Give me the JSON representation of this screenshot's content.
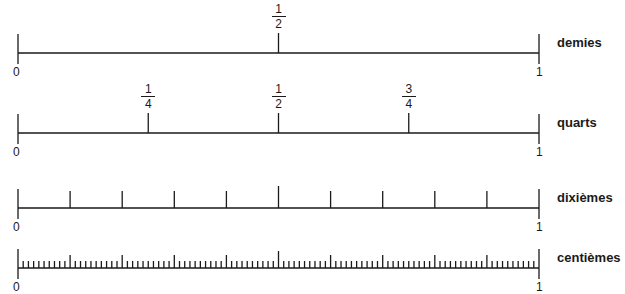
{
  "diagram": {
    "type": "number_lines",
    "x_start": 18,
    "x_end": 539,
    "line_color": "#1a1a1a",
    "lines": [
      {
        "name": "demies",
        "label": "demies",
        "y": 53,
        "divisions": 2,
        "start_label": "0",
        "end_label": "1",
        "fractions": [
          {
            "num": "1",
            "den": "2",
            "pos": 0.5
          }
        ]
      },
      {
        "name": "quarts",
        "label": "quarts",
        "y": 133,
        "divisions": 4,
        "start_label": "0",
        "end_label": "1",
        "fractions": [
          {
            "num": "1",
            "den": "4",
            "pos": 0.25
          },
          {
            "num": "1",
            "den": "2",
            "pos": 0.5
          },
          {
            "num": "3",
            "den": "4",
            "pos": 0.75
          }
        ]
      },
      {
        "name": "dixiemes",
        "label": "dixièmes",
        "y": 208,
        "divisions": 10,
        "start_label": "0",
        "end_label": "1",
        "fractions": []
      },
      {
        "name": "centiemes",
        "label": "centièmes",
        "y": 268,
        "divisions": 100,
        "start_label": "0",
        "end_label": "1",
        "fractions": []
      }
    ]
  }
}
